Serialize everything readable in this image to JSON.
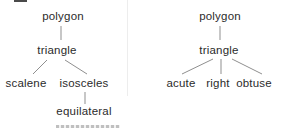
{
  "canvas": {
    "width": 281,
    "height": 129,
    "background": "#ffffff"
  },
  "style": {
    "text_color": "#2b2b2b",
    "edge_color": "#8f8f8f",
    "divider_color": "#ededed",
    "top_fragment_color": "#4a4a4a"
  },
  "diagram": {
    "type": "tree",
    "trees": [
      {
        "name": "triangle-by-sides",
        "nodes": [
          {
            "label": "polygon",
            "x": 63,
            "y": 17
          },
          {
            "label": "triangle",
            "x": 57,
            "y": 51
          },
          {
            "label": "scalene",
            "x": 26,
            "y": 84
          },
          {
            "label": "isosceles",
            "x": 84,
            "y": 84
          },
          {
            "label": "equilateral",
            "x": 84,
            "y": 112
          }
        ],
        "edges": [
          {
            "from": "polygon",
            "to": "triangle",
            "x1": 61,
            "y1": 26,
            "x2": 61,
            "y2": 40
          },
          {
            "from": "triangle",
            "to": "scalene",
            "x1": 47,
            "y1": 60,
            "x2": 33,
            "y2": 74
          },
          {
            "from": "triangle",
            "to": "isosceles",
            "x1": 65,
            "y1": 60,
            "x2": 87,
            "y2": 74
          },
          {
            "from": "isosceles",
            "to": "equilateral",
            "x1": 85,
            "y1": 92,
            "x2": 85,
            "y2": 104
          }
        ]
      },
      {
        "name": "triangle-by-angles",
        "nodes": [
          {
            "label": "polygon",
            "x": 220,
            "y": 17
          },
          {
            "label": "triangle",
            "x": 219,
            "y": 51
          },
          {
            "label": "acute",
            "x": 181,
            "y": 84
          },
          {
            "label": "right",
            "x": 218,
            "y": 84
          },
          {
            "label": "obtuse",
            "x": 254,
            "y": 84
          }
        ],
        "edges": [
          {
            "from": "polygon",
            "to": "triangle",
            "x1": 220,
            "y1": 26,
            "x2": 220,
            "y2": 40
          },
          {
            "from": "triangle",
            "to": "acute",
            "x1": 213,
            "y1": 59,
            "x2": 182,
            "y2": 74
          },
          {
            "from": "triangle",
            "to": "right",
            "x1": 221,
            "y1": 59,
            "x2": 221,
            "y2": 74
          },
          {
            "from": "triangle",
            "to": "obtuse",
            "x1": 232,
            "y1": 59,
            "x2": 262,
            "y2": 74
          }
        ]
      }
    ]
  },
  "fragments": {
    "divider": {
      "x": 127,
      "y": 0,
      "h": 96
    },
    "top": {
      "x": 14,
      "y": 0,
      "w": 13,
      "h": 2
    },
    "bottom": {
      "x": 56,
      "y": 125,
      "w": 64,
      "h": 3
    }
  }
}
